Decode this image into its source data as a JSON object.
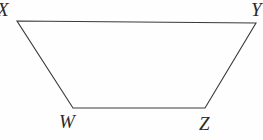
{
  "figure": {
    "kind": "trapezoid",
    "name": "trapezoid-wxyz",
    "background_color": "#fefefe",
    "stroke_color": "#3a3a3a",
    "stroke_width": 1.1,
    "fill": "none",
    "vertices": [
      {
        "label": "X",
        "x": 17,
        "y": 21,
        "position": "top-left",
        "clipped": true
      },
      {
        "label": "Y",
        "x": 256,
        "y": 23,
        "position": "top-right",
        "clipped": true
      },
      {
        "label": "Z",
        "x": 205,
        "y": 108,
        "position": "bottom-right",
        "clipped": false
      },
      {
        "label": "W",
        "x": 73,
        "y": 108,
        "position": "bottom-left",
        "clipped": false
      }
    ],
    "edges": [
      {
        "from": "X",
        "to": "Y",
        "name": "top-edge"
      },
      {
        "from": "Y",
        "to": "Z",
        "name": "right-edge"
      },
      {
        "from": "Z",
        "to": "W",
        "name": "bottom-edge"
      },
      {
        "from": "W",
        "to": "X",
        "name": "left-edge"
      }
    ],
    "path": "M 17 21 L 256 23 L 205 108 L 73 108 Z",
    "labels": {
      "x": "X",
      "y": "Y",
      "w": "W",
      "z": "Z"
    }
  }
}
